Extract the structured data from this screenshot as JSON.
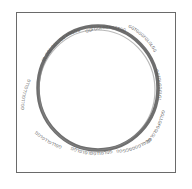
{
  "diagram": {
    "type": "circular-map",
    "ring_color": "#6e6e6e",
    "frame_color": "#6a6a6a",
    "label_color": "#555555",
    "labels": [
      {
        "id": "label-top-left",
        "text": "GL.GGL.GLL. GG ANGOG"
      },
      {
        "id": "label-top",
        "text": "GGFGGLGGFGGTGG"
      },
      {
        "id": "label-top-right",
        "text": "GGTGGGFGLGLGG"
      },
      {
        "id": "label-right",
        "text": "GGFGLGGGLGL"
      },
      {
        "id": "label-right-lower",
        "text": "GGLLGFGGLGLGG"
      },
      {
        "id": "label-bottom-right",
        "text": "GGGLGGGGGGGG"
      },
      {
        "id": "label-bottom",
        "text": "GGLGLLGGLGLGLGG"
      },
      {
        "id": "label-left-lower",
        "text": "GGLLGLLGLGG"
      },
      {
        "id": "label-left",
        "text": "GGLLGLLLGLLG"
      }
    ]
  }
}
